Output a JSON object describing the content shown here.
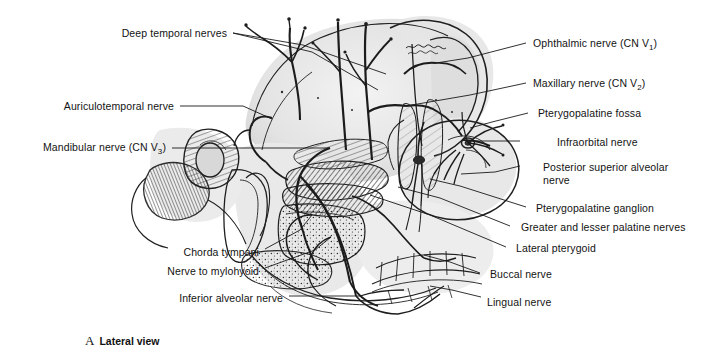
{
  "figure": {
    "caption_letter": "A",
    "caption_text": "Lateral view"
  },
  "labels_left": [
    {
      "id": "deep-temporal-nerves",
      "text": "Deep temporal nerves",
      "x": 120,
      "y": 27,
      "anchor_x": 231,
      "anchor_y": 33
    },
    {
      "id": "auriculotemporal-nerve",
      "text": "Auriculotemporal nerve",
      "x": 57,
      "y": 100,
      "anchor_x": 178,
      "anchor_y": 106
    },
    {
      "id": "mandibular-nerve",
      "text": "Mandibular nerve (CN V3)",
      "subscript": "3",
      "text_pre": "Mandibular nerve (CN V",
      "text_post": ")",
      "x": 33,
      "y": 141,
      "anchor_x": 170,
      "anchor_y": 148
    },
    {
      "id": "chorda-tympani",
      "text": "Chorda tympani",
      "x": 186,
      "y": 246,
      "anchor_x": 263,
      "anchor_y": 252
    },
    {
      "id": "nerve-to-mylohyoid",
      "text": "Nerve to mylohyoid",
      "x": 165,
      "y": 265,
      "anchor_x": 263,
      "anchor_y": 271
    },
    {
      "id": "inferior-alveolar-nerve",
      "text": "Inferior alveolar nerve",
      "x": 176,
      "y": 292,
      "anchor_x": 287,
      "anchor_y": 298
    }
  ],
  "labels_right": [
    {
      "id": "ophthalmic-nerve",
      "text": "Ophthalmic nerve (CN V1)",
      "subscript": "1",
      "text_pre": "Ophthalmic nerve (CN V",
      "text_post": ")",
      "x": 533,
      "y": 37,
      "anchor_x": 528,
      "anchor_y": 43
    },
    {
      "id": "maxillary-nerve",
      "text": "Maxillary nerve (CN V2)",
      "subscript": "2",
      "text_pre": "Maxillary nerve (CN V",
      "text_post": ")",
      "x": 533,
      "y": 77,
      "anchor_x": 528,
      "anchor_y": 83
    },
    {
      "id": "pterygopalatine-fossa",
      "text": "Pterygopalatine fossa",
      "x": 538,
      "y": 107,
      "anchor_x": 530,
      "anchor_y": 113
    },
    {
      "id": "infraorbital-nerve",
      "text": "Infraorbital nerve",
      "x": 557,
      "y": 136,
      "anchor_x": 522,
      "anchor_y": 141
    },
    {
      "id": "posterior-superior-alveolar-nerve",
      "text": "Posterior superior alveolar nerve",
      "x": 543,
      "y": 161,
      "anchor_x": 522,
      "anchor_y": 166
    },
    {
      "id": "pterygopalatine-ganglion",
      "text": "Pterygopalatine ganglion",
      "x": 536,
      "y": 202,
      "anchor_x": 528,
      "anchor_y": 207
    },
    {
      "id": "greater-lesser-palatine-nerves",
      "text": "Greater and lesser palatine nerves",
      "x": 521,
      "y": 221,
      "anchor_x": 512,
      "anchor_y": 226
    },
    {
      "id": "lateral-pterygoid",
      "text": "Lateral pterygoid",
      "x": 516,
      "y": 242,
      "anchor_x": 508,
      "anchor_y": 247
    },
    {
      "id": "buccal-nerve",
      "text": "Buccal nerve",
      "x": 490,
      "y": 268,
      "anchor_x": 482,
      "anchor_y": 273
    },
    {
      "id": "lingual-nerve",
      "text": "Lingual nerve",
      "x": 487,
      "y": 296,
      "anchor_x": 482,
      "anchor_y": 299
    }
  ],
  "leader_lines_left": [
    {
      "id": "leader-deep-temporal-a",
      "d": "M233,33 L303,45 L386,74"
    },
    {
      "id": "leader-deep-temporal-b",
      "d": "M233,33 L312,52 L378,90"
    },
    {
      "id": "leader-auriculotemporal",
      "d": "M180,106 L243,106 L272,119"
    },
    {
      "id": "leader-mandibular",
      "d": "M172,148 L330,148"
    },
    {
      "id": "leader-chorda-tympani",
      "d": "M265,249 L300,230 L312,215"
    },
    {
      "id": "leader-mylohyoid",
      "d": "M265,268 L315,250 L331,237"
    },
    {
      "id": "leader-inferior-alveolar",
      "d": "M289,296 L360,296"
    }
  ],
  "leader_lines_right": [
    {
      "id": "leader-ophthalmic",
      "d": "M526,43 L468,58 L436,63"
    },
    {
      "id": "leader-maxillary",
      "d": "M526,83 L470,95 L406,106"
    },
    {
      "id": "leader-pterygopalatine-fossa",
      "d": "M528,113 L492,122 L470,128"
    },
    {
      "id": "leader-infraorbital",
      "d": "M520,141 L470,141"
    },
    {
      "id": "leader-posterior-superior-alveolar",
      "d": "M520,166 L495,172 L461,174"
    },
    {
      "id": "leader-pterygopalatine-ganglion",
      "d": "M526,207 L460,186 L430,179"
    },
    {
      "id": "leader-greater-lesser-palatine",
      "d": "M510,226 L440,198 L398,187"
    },
    {
      "id": "leader-lateral-pterygoid",
      "d": "M506,247 L430,215 L370,195"
    },
    {
      "id": "leader-buccal",
      "d": "M480,273 L450,262 L424,255"
    },
    {
      "id": "leader-lingual",
      "d": "M481,297 L452,290 L430,286"
    }
  ],
  "colors": {
    "ink": "#1a1a1a",
    "text": "#131313",
    "background": "#ffffff",
    "wash_light": "#ededed",
    "wash_mid": "#cfcfcf",
    "wash_dark": "#9a9a9a",
    "muscle_dark": "#4a4a4a"
  }
}
